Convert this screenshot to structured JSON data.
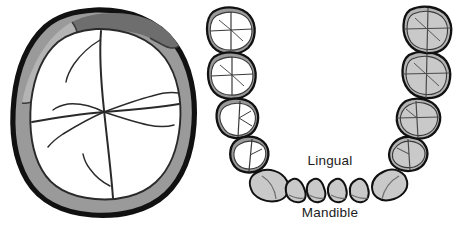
{
  "figure": {
    "background_color": "#ffffff"
  },
  "palette": {
    "outline": "#111111",
    "enamel_light": "#a8a8a8",
    "enamel_mid": "#9a9a9a",
    "enamel_dark": "#6e6e6e",
    "dentin_white": "#ffffff",
    "tooth_gray": "#c9c9c9",
    "tooth_gray_dark": "#b4b4b4",
    "groove_line": "#2a2a2a",
    "text_color": "#1b1b1b"
  },
  "left_panel": {
    "name": "mandibular-molar-occlusal-view",
    "description": "Large occlusal view of a mandibular molar",
    "outline_color": "#111111",
    "outline_width": 5,
    "enamel_ring": {
      "segments": [
        {
          "id": "enamel-segment-buccal",
          "shade": "#a8a8a8",
          "position": "left"
        },
        {
          "id": "enamel-segment-mesiobuccal",
          "shade": "#9a9a9a",
          "position": "lower-left"
        },
        {
          "id": "enamel-segment-occlusal-dark",
          "shade": "#6e6e6e",
          "position": "top"
        },
        {
          "id": "enamel-segment-distal",
          "shade": "#9a9a9a",
          "position": "right"
        }
      ]
    },
    "dentin_fill": "#ffffff",
    "cusps": 4,
    "groove_pattern": "cross-with-branching-fissures"
  },
  "right_panel": {
    "name": "mandibular-arch-diagram",
    "description": "Occlusal view of the mandibular dental arch, U-shape opening upward",
    "labels": {
      "lingual": "Lingual",
      "mandible": "Mandible"
    },
    "left_quadrant": {
      "fill_style": "white-interior-gray-rim",
      "teeth": [
        {
          "id": "tooth-ll-third-molar",
          "type": "molar",
          "fill": "#ffffff",
          "rim": "#9a9a9a",
          "cusps": 4
        },
        {
          "id": "tooth-ll-second-molar",
          "type": "molar",
          "fill": "#ffffff",
          "rim": "#9a9a9a",
          "cusps": 4
        },
        {
          "id": "tooth-ll-first-molar",
          "type": "premolar",
          "fill": "#ffffff",
          "rim": "#9a9a9a",
          "cusps": 2
        },
        {
          "id": "tooth-ll-premolar",
          "type": "premolar",
          "fill": "#ffffff",
          "rim": "#9a9a9a",
          "cusps": 2
        }
      ]
    },
    "right_quadrant": {
      "fill_style": "solid-gray",
      "teeth": [
        {
          "id": "tooth-lr-third-molar",
          "type": "molar",
          "fill": "#c9c9c9",
          "rim": "#b4b4b4",
          "cusps": 4
        },
        {
          "id": "tooth-lr-second-molar",
          "type": "molar",
          "fill": "#c9c9c9",
          "rim": "#b4b4b4",
          "cusps": 4
        },
        {
          "id": "tooth-lr-first-molar",
          "type": "premolar",
          "fill": "#c9c9c9",
          "rim": "#b4b4b4",
          "cusps": 2
        },
        {
          "id": "tooth-lr-premolar",
          "type": "premolar",
          "fill": "#c9c9c9",
          "rim": "#b4b4b4",
          "cusps": 2
        }
      ]
    },
    "anterior_teeth": {
      "fill_style": "solid-gray",
      "count": 8,
      "teeth": [
        {
          "id": "tooth-left-canine",
          "type": "canine",
          "fill": "#c9c9c9"
        },
        {
          "id": "tooth-left-lateral-incisor",
          "type": "lateral-incisor",
          "fill": "#c9c9c9"
        },
        {
          "id": "tooth-left-central-incisor",
          "type": "central-incisor",
          "fill": "#c9c9c9"
        },
        {
          "id": "tooth-right-central-incisor",
          "type": "central-incisor",
          "fill": "#c9c9c9"
        },
        {
          "id": "tooth-right-lateral-incisor",
          "type": "lateral-incisor",
          "fill": "#c9c9c9"
        },
        {
          "id": "tooth-right-canine",
          "type": "canine",
          "fill": "#c9c9c9"
        }
      ]
    },
    "total_teeth": 16
  }
}
